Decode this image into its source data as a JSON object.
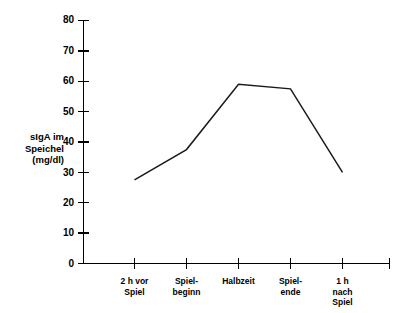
{
  "chart_data": {
    "type": "line",
    "title": "",
    "subtitle": "",
    "xlabel": "",
    "ylabel": "sIgA im\nSpeichel\n(mg/dl)",
    "ylabel_lines": [
      "sIgA im",
      "Speichel",
      "(mg/dl)"
    ],
    "categories": [
      "2 h vor\nSpiel",
      "Spiel-\nbeginn",
      "Halbzeit",
      "Spiel-\nende",
      "1 h\nnach\nSpiel"
    ],
    "category_lines": [
      [
        "2 h vor",
        "Spiel"
      ],
      [
        "Spiel-",
        "beginn"
      ],
      [
        "Halbzeit"
      ],
      [
        "Spiel-",
        "ende"
      ],
      [
        "1 h",
        "nach",
        "Spiel"
      ]
    ],
    "values": [
      27.5,
      37.5,
      59,
      57.5,
      30
    ],
    "series": [
      {
        "name": "sIgA im Speichel (mg/dl)",
        "values": [
          27.5,
          37.5,
          59,
          57.5,
          30
        ]
      }
    ],
    "ylim": [
      0,
      80
    ],
    "xlim": [
      0,
      6
    ],
    "yticks": [
      0,
      10,
      20,
      30,
      40,
      50,
      60,
      70,
      80
    ],
    "ytick_labels": [
      "0",
      "10",
      "20",
      "30",
      "40",
      "50",
      "60",
      "70",
      "80"
    ],
    "grid": false,
    "legend": null,
    "legend_position": "none",
    "annotations": [],
    "line_color": "#1a1a1a",
    "axis_color": "#000000",
    "background_color": "#ffffff"
  }
}
